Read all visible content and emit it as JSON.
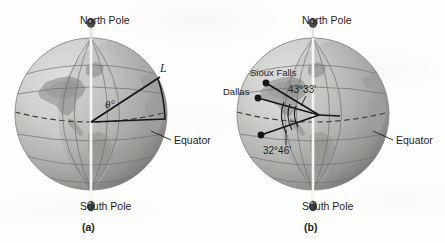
{
  "figure": {
    "type": "textbook-illustration",
    "background_color": "#fdfdfc",
    "ink_color": "#1d1d1d"
  },
  "panels": [
    {
      "caption": "(a)",
      "globe": {
        "center_x": 91,
        "center_y": 114,
        "radius": 76,
        "fill_light": "#d2d2d0",
        "fill_dark": "#8e8e8c",
        "grid_color": "#6f6f6d"
      },
      "axis": {
        "north_label": "North Pole",
        "south_label": "South Pole",
        "color": "#f4f4f2"
      },
      "equator_label": "Equator",
      "annotations": [
        {
          "name": "arc-length-label",
          "text": "L"
        },
        {
          "name": "central-angle-label",
          "text": "θ°"
        }
      ]
    },
    {
      "caption": "(b)",
      "globe": {
        "center_x": 313,
        "center_y": 114,
        "radius": 76,
        "fill_light": "#d2d2d0",
        "fill_dark": "#8e8e8c",
        "grid_color": "#6f6f6d"
      },
      "axis": {
        "north_label": "North Pole",
        "south_label": "South Pole",
        "color": "#f4f4f2"
      },
      "equator_label": "Equator",
      "cities": [
        {
          "name": "Sioux Falls",
          "latitude_label": "43°33'"
        },
        {
          "name": "Dallas",
          "latitude_label": "32°46'"
        }
      ]
    }
  ],
  "labels": {
    "north_pole": "North Pole",
    "south_pole": "South Pole",
    "equator": "Equator",
    "caption_a": "(a)",
    "caption_b": "(b)",
    "arc_length": "L",
    "theta": "θ°",
    "sioux_falls": "Sioux Falls",
    "dallas": "Dallas",
    "angle_sioux_falls": "43°33'",
    "angle_dallas": "32°46'"
  }
}
